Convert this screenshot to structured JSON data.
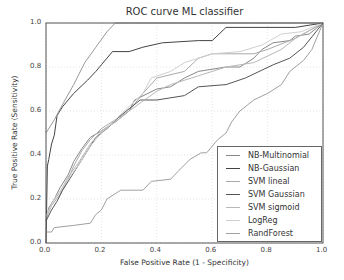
{
  "chart_data": {
    "type": "line",
    "title": "ROC curve ML classifier",
    "xlabel": "False Positive Rate (1 - Specificity)",
    "ylabel": "True Positive Rate (Sensitivity)",
    "xlim": [
      0.0,
      1.0
    ],
    "ylim": [
      0.0,
      1.0
    ],
    "xticks": [
      "0.0",
      "0.2",
      "0.4",
      "0.6",
      "0.8",
      "1.0"
    ],
    "yticks": [
      "0.0",
      "0.2",
      "0.4",
      "0.6",
      "0.8",
      "1.0"
    ],
    "grid": true,
    "legend_position": "lower right",
    "series": [
      {
        "name": "NB-Multinomial",
        "color": "#888888",
        "x": [
          0.0,
          0.01,
          0.03,
          0.05,
          0.08,
          0.1,
          0.13,
          0.16,
          0.2,
          0.25,
          0.3,
          0.32,
          0.4,
          0.45,
          0.5,
          0.55,
          0.65,
          0.7,
          0.75,
          0.78,
          0.82,
          0.88,
          0.9,
          0.95,
          1.0
        ],
        "y": [
          0.1,
          0.16,
          0.2,
          0.25,
          0.31,
          0.37,
          0.43,
          0.48,
          0.51,
          0.55,
          0.6,
          0.65,
          0.7,
          0.71,
          0.75,
          0.78,
          0.8,
          0.8,
          0.84,
          0.88,
          0.91,
          0.92,
          0.94,
          0.95,
          1.0
        ]
      },
      {
        "name": "NB-Gaussian",
        "color": "#444444",
        "x": [
          0.0,
          0.005,
          0.01,
          0.02,
          0.03,
          0.04,
          0.06,
          0.1,
          0.15,
          0.18,
          0.2,
          0.24,
          0.3,
          0.35,
          0.42,
          0.55,
          0.6,
          0.65,
          0.9,
          1.0
        ],
        "y": [
          0.0,
          0.35,
          0.38,
          0.45,
          0.49,
          0.58,
          0.62,
          0.68,
          0.74,
          0.78,
          0.81,
          0.87,
          0.87,
          0.89,
          0.91,
          0.92,
          0.92,
          0.98,
          0.98,
          1.0
        ]
      },
      {
        "name": "SVM lineal",
        "color": "#aaaaaa",
        "x": [
          0.0,
          0.02,
          0.05,
          0.08,
          0.1,
          0.13,
          0.16,
          0.2,
          0.25,
          0.3,
          0.35,
          0.4,
          0.5,
          0.55,
          0.6,
          0.75,
          0.8,
          0.9,
          1.0
        ],
        "y": [
          0.11,
          0.17,
          0.22,
          0.29,
          0.35,
          0.42,
          0.47,
          0.52,
          0.56,
          0.6,
          0.68,
          0.75,
          0.78,
          0.84,
          0.86,
          0.86,
          0.88,
          0.93,
          1.0
        ]
      },
      {
        "name": "SVM Gaussian",
        "color": "#555555",
        "x": [
          0.0,
          0.02,
          0.04,
          0.06,
          0.09,
          0.12,
          0.15,
          0.18,
          0.22,
          0.26,
          0.3,
          0.34,
          0.4,
          0.5,
          0.55,
          0.65,
          0.72,
          0.82,
          0.88,
          0.93,
          1.0
        ],
        "y": [
          0.1,
          0.15,
          0.19,
          0.24,
          0.3,
          0.36,
          0.42,
          0.48,
          0.52,
          0.57,
          0.61,
          0.65,
          0.65,
          0.67,
          0.71,
          0.72,
          0.75,
          0.81,
          0.84,
          0.89,
          1.0
        ]
      },
      {
        "name": "SVM sigmoid",
        "color": "#b8b8b8",
        "x": [
          0.0,
          0.02,
          0.05,
          0.08,
          0.12,
          0.16,
          0.2,
          0.25,
          0.3,
          0.4,
          0.45,
          0.55,
          0.65,
          0.75,
          0.85,
          0.9,
          1.0
        ],
        "y": [
          0.12,
          0.18,
          0.23,
          0.3,
          0.37,
          0.45,
          0.51,
          0.55,
          0.6,
          0.69,
          0.72,
          0.76,
          0.8,
          0.82,
          0.88,
          0.93,
          1.0
        ]
      },
      {
        "name": "LogReg",
        "color": "#d0d0d0",
        "x": [
          0.0,
          0.03,
          0.07,
          0.12,
          0.16,
          0.2,
          0.25,
          0.3,
          0.35,
          0.38,
          0.45,
          0.5,
          0.6,
          0.7,
          0.78,
          0.85,
          0.92,
          1.0
        ],
        "y": [
          0.12,
          0.2,
          0.27,
          0.36,
          0.44,
          0.5,
          0.56,
          0.62,
          0.68,
          0.75,
          0.78,
          0.82,
          0.86,
          0.87,
          0.9,
          0.95,
          0.96,
          1.0
        ]
      },
      {
        "name": "RandForest",
        "color": "#a0a0a0",
        "x": [
          0.0,
          0.02,
          0.03,
          0.1,
          0.16,
          0.18,
          0.2,
          0.22,
          0.27,
          0.35,
          0.38,
          0.45,
          0.48,
          0.52,
          0.56,
          0.58,
          0.62,
          0.65,
          0.67,
          0.7,
          0.75,
          0.8,
          0.85,
          0.88,
          0.93,
          0.96,
          1.0
        ],
        "y": [
          0.05,
          0.05,
          0.07,
          0.08,
          0.09,
          0.13,
          0.15,
          0.2,
          0.24,
          0.24,
          0.28,
          0.29,
          0.33,
          0.38,
          0.41,
          0.41,
          0.47,
          0.5,
          0.55,
          0.6,
          0.65,
          0.68,
          0.72,
          0.78,
          0.83,
          0.88,
          1.0
        ]
      },
      {
        "name": "(unlabeled top curve)",
        "color": "#999999",
        "x": [
          0.0,
          0.03,
          0.06,
          0.1,
          0.14,
          0.18,
          0.22,
          0.25,
          1.0
        ],
        "y": [
          0.5,
          0.56,
          0.63,
          0.72,
          0.82,
          0.89,
          0.96,
          1.0,
          1.0
        ]
      }
    ]
  }
}
